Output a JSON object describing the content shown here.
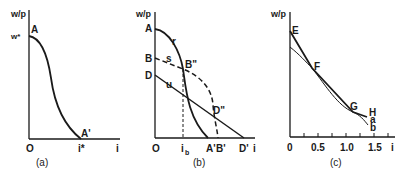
{
  "panels": [
    {
      "id": "a",
      "caption": "(a)",
      "y_axis_label": "w/p",
      "x_axis_label": "i",
      "origin_label": "O",
      "y_tick_label": "w*",
      "x_tick_label": "i*",
      "points": {
        "A": "A",
        "A_prime": "A'"
      },
      "curves": [
        {
          "name": "A-A'",
          "style": "solid",
          "shape": "reverse-S decreasing"
        }
      ]
    },
    {
      "id": "b",
      "caption": "(b)",
      "y_axis_label": "w/p",
      "x_axis_label": "i",
      "origin_label": "O",
      "y_labels": {
        "A": "A",
        "B": "B",
        "D": "D"
      },
      "x_labels": {
        "i_b": "i",
        "i_b_sub": "b",
        "A_prime": "A'",
        "B_prime": "B'",
        "D_prime": "D'"
      },
      "curve_labels": {
        "r": "r",
        "s": "s",
        "u": "u"
      },
      "points": {
        "B_dprime": "B\"",
        "D_dprime": "D\""
      },
      "curves": [
        {
          "name": "r",
          "style": "solid",
          "from": "A",
          "to": "A'"
        },
        {
          "name": "s",
          "style": "dashed",
          "from": "B",
          "to": "B'"
        },
        {
          "name": "u",
          "style": "solid",
          "from": "D",
          "to": "D'"
        }
      ]
    },
    {
      "id": "c",
      "caption": "(c)",
      "y_axis_label": "w/p",
      "x_axis_label": "i",
      "x_ticks": [
        "0",
        "0.5",
        "1.0",
        "1.5"
      ],
      "point_labels": {
        "E": "E",
        "F": "F",
        "G": "G",
        "H": "H"
      },
      "curve_labels": {
        "a": "a",
        "b": "b"
      },
      "curves": [
        {
          "name": "a",
          "style": "solid-thick",
          "from": "E",
          "through": [
            "F",
            "G"
          ],
          "to": "H"
        },
        {
          "name": "b",
          "style": "solid-thin",
          "shape": "convex",
          "through": [
            "F",
            "G"
          ]
        }
      ]
    }
  ]
}
